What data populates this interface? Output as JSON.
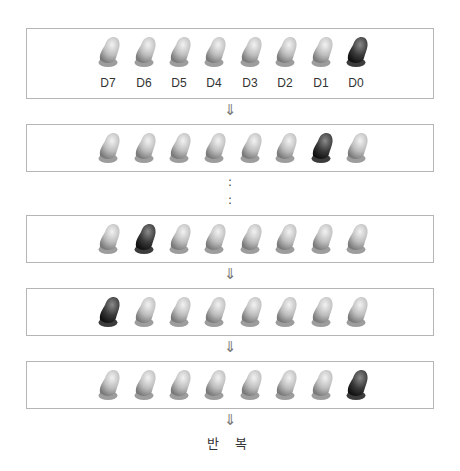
{
  "labels": [
    "D7",
    "D6",
    "D5",
    "D4",
    "D3",
    "D2",
    "D1",
    "D0"
  ],
  "colors": {
    "led_off": "#c4c4c4",
    "led_on": "#2e2e2e",
    "border": "#b5b5b5"
  },
  "icons": {
    "arrow": "down-double-arrow-icon",
    "continuation": "vertical-ellipsis"
  },
  "arrow_glyph": "⇓",
  "dots_glyph": ":",
  "repeat_text": "반 복",
  "states": [
    [
      0,
      0,
      0,
      0,
      0,
      0,
      0,
      1
    ],
    [
      0,
      0,
      0,
      0,
      0,
      0,
      1,
      0
    ],
    [
      0,
      1,
      0,
      0,
      0,
      0,
      0,
      0
    ],
    [
      1,
      0,
      0,
      0,
      0,
      0,
      0,
      0
    ],
    [
      0,
      0,
      0,
      0,
      0,
      0,
      0,
      1
    ]
  ]
}
